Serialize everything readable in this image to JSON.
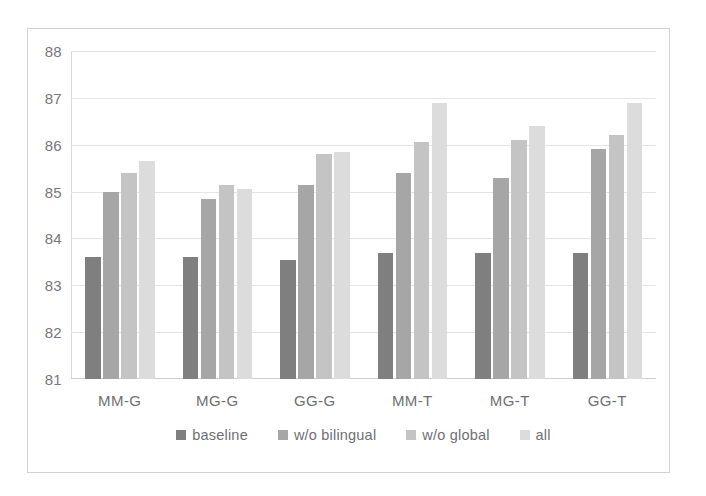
{
  "figure": {
    "frame_color": "#d2d2d2",
    "background": "#ffffff"
  },
  "chart_data": {
    "type": "bar",
    "title": "",
    "subtitle": "",
    "xlabel": "",
    "ylabel": "",
    "ylim": [
      81,
      88
    ],
    "ytick_step": 1,
    "yticks": [
      "88",
      "87",
      "86",
      "85",
      "84",
      "83",
      "82",
      "81"
    ],
    "grid": true,
    "grid_axis": "y",
    "legend_position": "bottom-center",
    "categories": [
      "MM-G",
      "MG-G",
      "GG-G",
      "MM-T",
      "MG-T",
      "GG-T"
    ],
    "series": [
      {
        "name": "baseline",
        "color": "#7f7f7f",
        "values": [
          83.6,
          83.6,
          83.55,
          83.7,
          83.7,
          83.7
        ]
      },
      {
        "name": "w/o bilingual",
        "color": "#a6a6a6",
        "values": [
          85.0,
          84.85,
          85.15,
          85.4,
          85.3,
          85.9
        ]
      },
      {
        "name": "w/o global",
        "color": "#c4c4c4",
        "values": [
          85.4,
          85.15,
          85.8,
          86.05,
          86.1,
          86.2
        ]
      },
      {
        "name": "all",
        "color": "#dcdcdc",
        "values": [
          85.65,
          85.05,
          85.85,
          86.9,
          86.4,
          86.9
        ]
      }
    ]
  },
  "legend": {
    "items": [
      {
        "label": "baseline",
        "color": "#7f7f7f"
      },
      {
        "label": "w/o bilingual",
        "color": "#a6a6a6"
      },
      {
        "label": "w/o global",
        "color": "#c4c4c4"
      },
      {
        "label": "all",
        "color": "#dcdcdc"
      }
    ]
  }
}
